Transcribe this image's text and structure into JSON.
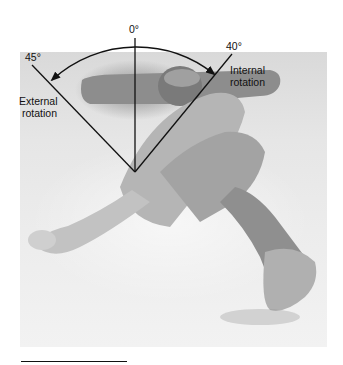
{
  "figure": {
    "angles": {
      "neutral": "0°",
      "external": "45°",
      "internal": "40°"
    },
    "labels": {
      "external_line1": "External",
      "external_line2": "rotation",
      "internal_line1": "Internal",
      "internal_line2": "rotation"
    },
    "colors": {
      "ink": "#111111",
      "background": "#ffffff",
      "photo_base": "#e6e6e6"
    }
  }
}
